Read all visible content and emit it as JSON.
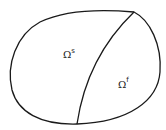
{
  "diagram": {
    "regions": [
      {
        "id": "solid",
        "symbol": "Ω",
        "superscript": "s"
      },
      {
        "id": "fluid",
        "symbol": "Ω",
        "superscript": "f"
      }
    ],
    "stroke_color": "#1a1a1a"
  }
}
